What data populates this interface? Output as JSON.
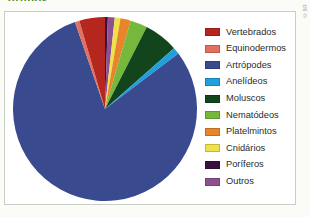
{
  "figure": {
    "title_remnant": "grupos",
    "credit": "©BR"
  },
  "chart_data": {
    "type": "pie",
    "title": "",
    "subtitle": "",
    "xlabel": "",
    "ylabel": "",
    "grid": false,
    "legend_position": "right",
    "start_angle_deg": 0,
    "direction": "clockwise",
    "center": [
      100,
      105
    ],
    "radius": 92,
    "labels": [
      "Vertebrados",
      "Equinodermos",
      "Artrópodes",
      "Anelídeos",
      "Moluscos",
      "Nematódeos",
      "Platelmintos",
      "Cnidários",
      "Poríferos",
      "Outros"
    ],
    "values": [
      4.5,
      0.8,
      80.0,
      1.2,
      6.0,
      3.0,
      1.8,
      1.0,
      0.5,
      1.2
    ],
    "colors": [
      "#b5261f",
      "#e3705f",
      "#3a4a8f",
      "#1f9fdc",
      "#13451c",
      "#76b83c",
      "#e8842a",
      "#efe14a",
      "#3a1040",
      "#8d5191"
    ],
    "slice_order_clockwise_from_top": [
      "Poríferos",
      "Outros",
      "Cnidários",
      "Platelmintos",
      "Nematódeos",
      "Moluscos",
      "Anelídeos",
      "Artrópodes",
      "Equinodermos",
      "Vertebrados"
    ],
    "slice_order_values": [
      0.5,
      1.2,
      1.0,
      1.8,
      3.0,
      6.0,
      1.2,
      80.0,
      0.8,
      4.5
    ]
  },
  "legend": {
    "items": [
      {
        "label": "Vertebrados",
        "color": "#b5261f"
      },
      {
        "label": "Equinodermos",
        "color": "#e3705f"
      },
      {
        "label": "Artrópodes",
        "color": "#3a4a8f"
      },
      {
        "label": "Anelídeos",
        "color": "#1f9fdc"
      },
      {
        "label": "Moluscos",
        "color": "#13451c"
      },
      {
        "label": "Nematódeos",
        "color": "#76b83c"
      },
      {
        "label": "Platelmintos",
        "color": "#e8842a"
      },
      {
        "label": "Cnidários",
        "color": "#efe14a"
      },
      {
        "label": "Poríferos",
        "color": "#3a1040"
      },
      {
        "label": "Outros",
        "color": "#8d5191"
      }
    ]
  }
}
